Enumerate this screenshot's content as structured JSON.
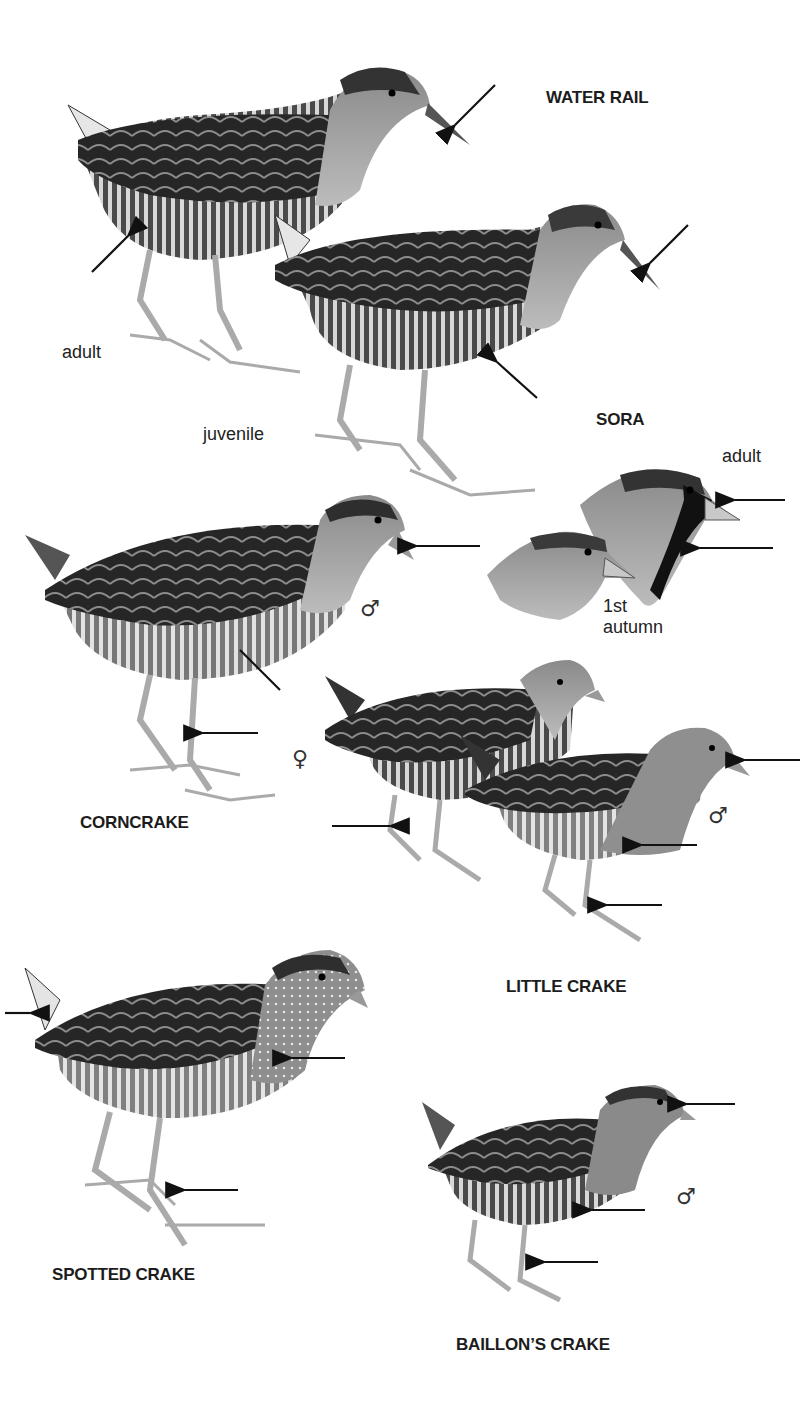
{
  "plate": {
    "species": [
      {
        "name": "WATER RAIL",
        "labels": [
          "adult",
          "juvenile"
        ]
      },
      {
        "name": "SORA",
        "labels": [
          "adult",
          "1st",
          "autumn"
        ]
      },
      {
        "name": "CORNCRAKE",
        "sex": "♂"
      },
      {
        "name": "LITTLE CRAKE",
        "sex": [
          "♀",
          "♂"
        ]
      },
      {
        "name": "SPOTTED CRAKE"
      },
      {
        "name": "BAILLON'S CRAKE",
        "display": "BAILLON’S CRAKE",
        "sex": "♂"
      }
    ],
    "symbols": {
      "male": "♂",
      "female": "♀"
    },
    "colors": {
      "background": "#ffffff",
      "ink": "#1a1a1a",
      "plumage_dark": "#2a2a2a",
      "plumage_mid": "#7a7a7a",
      "plumage_light": "#c8c8c8"
    }
  }
}
